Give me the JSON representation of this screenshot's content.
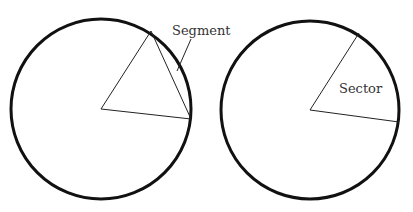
{
  "diagram": {
    "left": {
      "label": "Segment",
      "circle": {
        "cx": 101,
        "cy": 109,
        "r": 90
      },
      "triangle": [
        [
          101,
          109
        ],
        [
          151,
          31
        ],
        [
          191,
          119
        ]
      ],
      "pointer": [
        [
          191,
          39
        ],
        [
          177,
          71
        ]
      ],
      "label_pos": [
        172,
        35
      ]
    },
    "right": {
      "label": "Sector",
      "circle": {
        "cx": 310,
        "cy": 110,
        "r": 89
      },
      "radii": [
        [
          [
            310,
            110
          ],
          [
            359,
            33
          ]
        ],
        [
          [
            310,
            110
          ],
          [
            399,
            122
          ]
        ]
      ],
      "label_pos": [
        339,
        93
      ]
    },
    "colors": {
      "stroke": "#111111",
      "text": "#333333"
    }
  }
}
